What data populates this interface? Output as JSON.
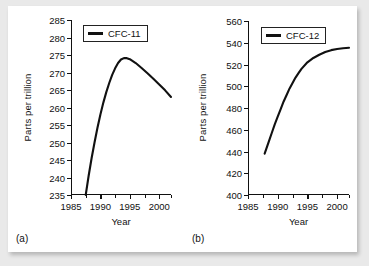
{
  "figure": {
    "background": "#ffffff",
    "outer_background": "#e9e9e9",
    "line_color": "#111111"
  },
  "panels": [
    {
      "tag": "(a)",
      "legend_label": "CFC-11",
      "xlabel": "Year",
      "ylabel": "Parts per trillion"
    },
    {
      "tag": "(b)",
      "legend_label": "CFC-12",
      "xlabel": "Year",
      "ylabel": "Parts per trillion"
    }
  ],
  "chart_data": [
    {
      "type": "line",
      "title": "",
      "panel": "(a)",
      "xlabel": "Year",
      "ylabel": "Parts per trillion",
      "xlim": [
        1985,
        2002
      ],
      "ylim": [
        235,
        285
      ],
      "xticks": [
        1985,
        1990,
        1995,
        2000
      ],
      "xticklabels": [
        "1985",
        "1990",
        "1995",
        "2000"
      ],
      "xminor_ticks": [
        1987.5,
        1992.5,
        1997.5,
        2002
      ],
      "yticks": [
        235,
        240,
        245,
        250,
        255,
        260,
        265,
        270,
        275,
        280,
        285
      ],
      "yticklabels": [
        "235",
        "240",
        "245",
        "250",
        "255",
        "260",
        "265",
        "270",
        "275",
        "280",
        "285"
      ],
      "grid": false,
      "legend": [
        "CFC-11"
      ],
      "legend_position": "upper left",
      "series": [
        {
          "name": "CFC-11",
          "x": [
            1987.5,
            1988,
            1988.5,
            1989,
            1989.5,
            1990,
            1990.5,
            1991,
            1991.5,
            1992,
            1992.5,
            1993,
            1993.5,
            1994,
            1994.5,
            1995,
            1996,
            1997,
            1998,
            1999,
            2000,
            2001,
            2002
          ],
          "values": [
            235,
            240.5,
            245.5,
            250,
            254.2,
            258,
            261.4,
            264.4,
            267,
            269.3,
            271.2,
            272.7,
            273.7,
            274.1,
            274.1,
            273.8,
            272.7,
            271.3,
            269.8,
            268.2,
            266.6,
            264.9,
            263.0
          ]
        }
      ]
    },
    {
      "type": "line",
      "title": "",
      "panel": "(b)",
      "xlabel": "Year",
      "ylabel": "Parts per trillion",
      "xlim": [
        1985,
        2002
      ],
      "ylim": [
        400,
        560
      ],
      "xticks": [
        1985,
        1990,
        1995,
        2000
      ],
      "xticklabels": [
        "1985",
        "1990",
        "1995",
        "2000"
      ],
      "xminor_ticks": [
        1987.5,
        1992.5,
        1997.5,
        2002
      ],
      "yticks": [
        400,
        420,
        440,
        460,
        480,
        500,
        520,
        540,
        560
      ],
      "yticklabels": [
        "400",
        "420",
        "440",
        "460",
        "480",
        "500",
        "520",
        "540",
        "560"
      ],
      "grid": false,
      "legend": [
        "CFC-12"
      ],
      "legend_position": "upper left",
      "series": [
        {
          "name": "CFC-12",
          "x": [
            1987.8,
            1988.5,
            1989,
            1989.5,
            1990,
            1990.5,
            1991,
            1991.5,
            1992,
            1992.5,
            1993,
            1993.5,
            1994,
            1995,
            1996,
            1997,
            1998,
            1999,
            2000,
            2001,
            2002
          ],
          "values": [
            438,
            449,
            457,
            465,
            472,
            479,
            486,
            492,
            498,
            503,
            508,
            512,
            516,
            522,
            526,
            529,
            531.5,
            533.2,
            534.3,
            535.0,
            535.4
          ]
        }
      ]
    }
  ]
}
